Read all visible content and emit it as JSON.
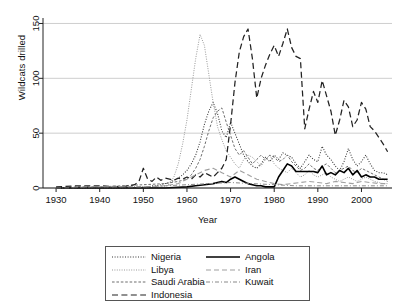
{
  "chart_data": {
    "type": "line",
    "title": "",
    "xlabel": "Year",
    "ylabel": "Wildcats drilled",
    "xlim": [
      1927,
      2007
    ],
    "ylim": [
      0,
      155
    ],
    "xticks": [
      1930,
      1940,
      1950,
      1960,
      1970,
      1980,
      1990,
      2000
    ],
    "yticks": [
      0,
      50,
      100,
      150
    ],
    "grid": "horizontal",
    "legend_position": "below-axes",
    "series": [
      {
        "name": "Nigeria",
        "style": "dotted",
        "color": "#333333",
        "x": [
          1930,
          1935,
          1940,
          1945,
          1950,
          1951,
          1952,
          1953,
          1954,
          1955,
          1956,
          1957,
          1958,
          1959,
          1960,
          1961,
          1962,
          1963,
          1964,
          1965,
          1966,
          1967,
          1968,
          1969,
          1970,
          1971,
          1972,
          1973,
          1974,
          1975,
          1976,
          1977,
          1978,
          1979,
          1980,
          1981,
          1982,
          1983,
          1984,
          1985,
          1986,
          1987,
          1988,
          1989,
          1990,
          1991,
          1992,
          1993,
          1994,
          1995,
          1996,
          1997,
          1998,
          1999,
          2000,
          2001,
          2002,
          2003,
          2004,
          2005,
          2006
        ],
        "values": [
          0,
          0,
          0,
          0,
          1,
          1,
          2,
          2,
          3,
          4,
          5,
          7,
          9,
          12,
          16,
          22,
          30,
          42,
          58,
          70,
          78,
          68,
          52,
          46,
          60,
          50,
          40,
          30,
          24,
          20,
          18,
          22,
          28,
          24,
          30,
          26,
          32,
          30,
          28,
          22,
          18,
          24,
          30,
          26,
          24,
          38,
          30,
          26,
          20,
          16,
          24,
          36,
          26,
          20,
          24,
          30,
          22,
          16,
          14,
          14,
          12
        ]
      },
      {
        "name": "Libya",
        "style": "fine-dotted",
        "color": "#9a9a9a",
        "x": [
          1930,
          1940,
          1950,
          1955,
          1956,
          1957,
          1958,
          1959,
          1960,
          1961,
          1962,
          1963,
          1964,
          1965,
          1966,
          1967,
          1968,
          1969,
          1970,
          1971,
          1972,
          1973,
          1974,
          1975,
          1976,
          1977,
          1978,
          1979,
          1980,
          1981,
          1982,
          1983,
          1984,
          1985,
          1986,
          1987,
          1988,
          1989,
          1990,
          1991,
          1992,
          1993,
          1994,
          1995,
          1996,
          1997,
          1998,
          1999,
          2000,
          2001,
          2002,
          2003,
          2004,
          2005,
          2006
        ],
        "values": [
          0,
          0,
          0,
          1,
          4,
          10,
          22,
          40,
          62,
          90,
          118,
          140,
          130,
          104,
          78,
          56,
          44,
          34,
          28,
          22,
          18,
          26,
          30,
          28,
          24,
          20,
          26,
          30,
          22,
          18,
          16,
          14,
          18,
          14,
          10,
          12,
          16,
          12,
          10,
          12,
          14,
          10,
          8,
          6,
          8,
          10,
          8,
          6,
          8,
          10,
          8,
          6,
          5,
          4,
          4
        ]
      },
      {
        "name": "Saudi Arabia",
        "style": "dashed-short",
        "color": "#6f6f6f",
        "x": [
          1930,
          1935,
          1940,
          1945,
          1950,
          1955,
          1958,
          1960,
          1961,
          1962,
          1963,
          1964,
          1965,
          1966,
          1967,
          1968,
          1969,
          1970,
          1971,
          1972,
          1973,
          1974,
          1975,
          1976,
          1977,
          1978,
          1979,
          1980,
          1981,
          1982,
          1983,
          1984,
          1985,
          1986,
          1987,
          1988,
          1989,
          1990,
          1991,
          1992,
          1993,
          1994,
          1995,
          1996,
          1997,
          1998,
          1999,
          2000,
          2001,
          2002,
          2003,
          2004,
          2005,
          2006
        ],
        "values": [
          0,
          1,
          1,
          2,
          3,
          4,
          6,
          8,
          12,
          18,
          26,
          38,
          52,
          64,
          70,
          73,
          60,
          48,
          36,
          30,
          34,
          28,
          22,
          26,
          30,
          26,
          30,
          28,
          24,
          26,
          30,
          24,
          20,
          16,
          18,
          22,
          18,
          16,
          20,
          22,
          18,
          14,
          16,
          18,
          20,
          16,
          14,
          18,
          16,
          14,
          12,
          10,
          8,
          6
        ]
      },
      {
        "name": "Indonesia",
        "style": "dashed-long",
        "color": "#222222",
        "x": [
          1930,
          1935,
          1940,
          1945,
          1948,
          1949,
          1950,
          1951,
          1952,
          1953,
          1954,
          1955,
          1956,
          1957,
          1958,
          1959,
          1960,
          1961,
          1962,
          1963,
          1964,
          1965,
          1966,
          1967,
          1968,
          1969,
          1970,
          1971,
          1972,
          1973,
          1974,
          1975,
          1976,
          1977,
          1978,
          1979,
          1980,
          1981,
          1982,
          1983,
          1984,
          1985,
          1986,
          1987,
          1988,
          1989,
          1990,
          1991,
          1992,
          1993,
          1994,
          1995,
          1996,
          1997,
          1998,
          1999,
          2000,
          2001,
          2002,
          2003,
          2004,
          2005,
          2006
        ],
        "values": [
          1,
          2,
          2,
          1,
          3,
          6,
          18,
          8,
          6,
          10,
          7,
          9,
          8,
          7,
          9,
          8,
          10,
          8,
          12,
          10,
          14,
          12,
          10,
          14,
          18,
          26,
          58,
          96,
          124,
          138,
          145,
          118,
          82,
          100,
          112,
          122,
          130,
          120,
          132,
          145,
          128,
          120,
          118,
          54,
          72,
          88,
          78,
          98,
          84,
          70,
          48,
          62,
          80,
          74,
          56,
          62,
          78,
          72,
          56,
          52,
          46,
          40,
          33
        ]
      },
      {
        "name": "Angola",
        "style": "solid",
        "color": "#000000",
        "x": [
          1930,
          1940,
          1950,
          1955,
          1960,
          1962,
          1964,
          1966,
          1968,
          1969,
          1970,
          1971,
          1972,
          1973,
          1974,
          1975,
          1976,
          1977,
          1978,
          1979,
          1980,
          1981,
          1982,
          1983,
          1984,
          1985,
          1986,
          1987,
          1988,
          1989,
          1990,
          1991,
          1992,
          1993,
          1994,
          1995,
          1996,
          1997,
          1998,
          1999,
          2000,
          2001,
          2002,
          2003,
          2004,
          2005,
          2006
        ],
        "values": [
          0,
          0,
          0,
          0,
          1,
          2,
          3,
          4,
          6,
          5,
          8,
          10,
          8,
          6,
          4,
          3,
          2,
          2,
          1,
          1,
          1,
          10,
          16,
          22,
          20,
          15,
          15,
          15,
          15,
          15,
          14,
          20,
          12,
          14,
          12,
          16,
          14,
          18,
          12,
          16,
          10,
          12,
          10,
          10,
          8,
          8,
          8
        ]
      },
      {
        "name": "Iran",
        "style": "dashed-medium",
        "color": "#a0a0a0",
        "x": [
          1930,
          1940,
          1950,
          1955,
          1958,
          1960,
          1962,
          1964,
          1966,
          1968,
          1970,
          1972,
          1974,
          1976,
          1978,
          1980,
          1982,
          1984,
          1986,
          1988,
          1990,
          1992,
          1994,
          1996,
          1998,
          2000,
          2002,
          2004,
          2006
        ],
        "values": [
          0,
          1,
          1,
          2,
          4,
          8,
          12,
          16,
          18,
          14,
          10,
          16,
          12,
          8,
          6,
          4,
          3,
          4,
          5,
          6,
          5,
          4,
          6,
          5,
          4,
          6,
          5,
          4,
          4
        ]
      },
      {
        "name": "Kuwait",
        "style": "dash-dot",
        "color": "#8a8a8a",
        "x": [
          1930,
          1940,
          1950,
          1955,
          1960,
          1965,
          1970,
          1975,
          1980,
          1985,
          1990,
          1995,
          2000,
          2006
        ],
        "values": [
          0,
          1,
          1,
          2,
          3,
          4,
          5,
          4,
          3,
          2,
          2,
          2,
          2,
          2
        ]
      }
    ]
  },
  "axes": {
    "x_tick_labels": [
      "1930",
      "1940",
      "1950",
      "1960",
      "1970",
      "1980",
      "1990",
      "2000"
    ],
    "y_tick_labels": [
      "0",
      "50",
      "100",
      "150"
    ],
    "x_axis_title": "Year",
    "y_axis_title": "Wildcats drilled"
  },
  "legend": {
    "column_left": [
      {
        "label": "Nigeria",
        "key": "nigeria-line-key"
      },
      {
        "label": "Libya",
        "key": "libya-line-key"
      },
      {
        "label": "Saudi Arabia",
        "key": "saudi-arabia-line-key"
      },
      {
        "label": "Indonesia",
        "key": "indonesia-line-key"
      }
    ],
    "column_right": [
      {
        "label": "Angola",
        "key": "angola-line-key"
      },
      {
        "label": "Iran",
        "key": "iran-line-key"
      },
      {
        "label": "Kuwait",
        "key": "kuwait-line-key"
      }
    ]
  },
  "colors": {
    "axis": "#222222",
    "grid": "#c8c8c8",
    "background": "#ffffff"
  }
}
